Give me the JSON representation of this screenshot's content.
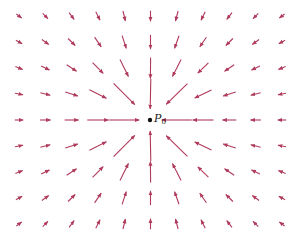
{
  "diagram": {
    "type": "vector-field",
    "arrow_color": "#b03a5b",
    "point_color": "#111111",
    "grid": {
      "columns": 11,
      "rows": 9,
      "x0": 19,
      "dx": 26.3,
      "y0": 16,
      "dy": 26
    },
    "magnitude_constant": 1100,
    "max_length": 30,
    "center_point": {
      "x": 150,
      "y": 120,
      "label_main": "P",
      "label_sub": "0"
    }
  }
}
